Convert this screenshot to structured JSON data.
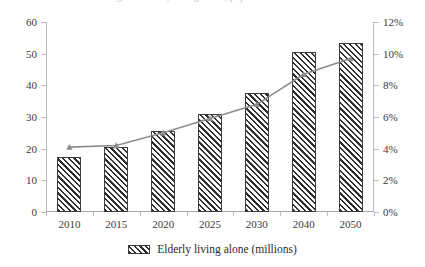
{
  "chart_data": {
    "type": "bar",
    "title": "",
    "categories": [
      "2010",
      "2015",
      "2020",
      "2025",
      "2030",
      "2040",
      "2050"
    ],
    "xlabel": "",
    "ylabel": "",
    "ylim": [
      0,
      60
    ],
    "yticks": [
      "0",
      "10",
      "20",
      "30",
      "40",
      "50",
      "60"
    ],
    "ytick_values": [
      0,
      10,
      20,
      30,
      40,
      50,
      60
    ],
    "y2lim": [
      0,
      12
    ],
    "y2ticks": [
      "0%",
      "2%",
      "4%",
      "6%",
      "8%",
      "10%",
      "12%"
    ],
    "y2tick_values": [
      0,
      2,
      4,
      6,
      8,
      10,
      12
    ],
    "grid": false,
    "legend_position": "bottom",
    "series": [
      {
        "name": "Elderly living alone (millions)",
        "type": "bar",
        "axis": "left",
        "values": [
          17.5,
          20.5,
          25.5,
          31.0,
          37.5,
          50.5,
          53.5
        ],
        "color": "#2f2f2f",
        "fill": "hatch-diagonal"
      },
      {
        "name": "",
        "type": "line",
        "axis": "right",
        "values": [
          4.1,
          4.2,
          5.0,
          5.9,
          6.8,
          8.7,
          9.7
        ],
        "color": "#8c8c8c",
        "marker": "triangle"
      }
    ]
  },
  "legend": {
    "swatch_name": "hatch-swatch",
    "label": "Elderly living alone (millions)"
  },
  "colors": {
    "bar_hatch": "#2f2f2f",
    "bar_border": "#3d3d3d",
    "line": "#8c8c8c",
    "axis": "#b9b9b9",
    "text": "#2b2b2b"
  },
  "title_sliver": "Figure: Elderly living alone, population and share"
}
